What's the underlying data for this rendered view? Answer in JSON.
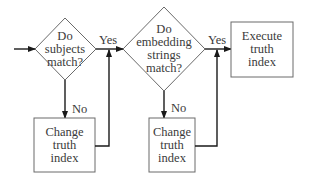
{
  "diagram": {
    "type": "flowchart",
    "nodes": [
      {
        "id": "d1",
        "shape": "diamond",
        "lines": [
          "Do",
          "subjects",
          "match?"
        ]
      },
      {
        "id": "d2",
        "shape": "diamond",
        "lines": [
          "Do",
          "embedding",
          "strings",
          "match?"
        ]
      },
      {
        "id": "exec",
        "shape": "box",
        "lines": [
          "Execute",
          "truth",
          "index"
        ]
      },
      {
        "id": "c1",
        "shape": "box",
        "lines": [
          "Change",
          "truth",
          "index"
        ]
      },
      {
        "id": "c2",
        "shape": "box",
        "lines": [
          "Change",
          "truth",
          "index"
        ]
      }
    ],
    "edges": [
      {
        "from": "start",
        "to": "d1",
        "label": ""
      },
      {
        "from": "d1",
        "to": "d2",
        "label": "Yes"
      },
      {
        "from": "d1",
        "to": "c1",
        "label": "No"
      },
      {
        "from": "c1",
        "to": "d1-d2-connector",
        "label": ""
      },
      {
        "from": "d2",
        "to": "exec",
        "label": "Yes"
      },
      {
        "from": "d2",
        "to": "c2",
        "label": "No"
      },
      {
        "from": "c2",
        "to": "d2-exec-connector",
        "label": ""
      }
    ]
  },
  "labels": {
    "d1": {
      "l0": "Do",
      "l1": "subjects",
      "l2": "match?"
    },
    "d2": {
      "l0": "Do",
      "l1": "embedding",
      "l2": "strings",
      "l3": "match?"
    },
    "exec": {
      "l0": "Execute",
      "l1": "truth",
      "l2": "index"
    },
    "c1": {
      "l0": "Change",
      "l1": "truth",
      "l2": "index"
    },
    "c2": {
      "l0": "Change",
      "l1": "truth",
      "l2": "index"
    },
    "yes1": "Yes",
    "yes2": "Yes",
    "no1": "No",
    "no2": "No"
  },
  "colors": {
    "stroke": "#5a5a5a",
    "arrow": "#1a1a1a",
    "text": "#3a3a3a"
  }
}
